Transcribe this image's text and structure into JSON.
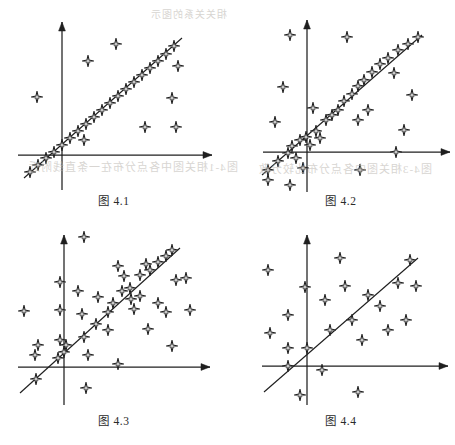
{
  "page": {
    "width": 455,
    "height": 445,
    "background": "#ffffff",
    "ink_color": "#1f1f1f",
    "marker_fill": "#ffffff",
    "marker_stroke": "#1f1f1f",
    "bleed_color": "#b9b4ae"
  },
  "bleed_through": [
    {
      "text": "图4-1相关图中各点分布在一条直线附近",
      "x": 28,
      "y": 158,
      "size": 11
    },
    {
      "text": "图4-3相关图中各点分布比较分散",
      "x": 258,
      "y": 160,
      "size": 11
    },
    {
      "text": "相关关系的图示",
      "x": 150,
      "y": 6,
      "size": 10
    }
  ],
  "chart_data": [
    {
      "id": "figure-4-1",
      "type": "scatter",
      "title": "图 4.1",
      "caption": "图 4.1",
      "correlation_label": "very strong positive linear correlation",
      "xlabel": "",
      "ylabel": "",
      "grid": false,
      "legend": false,
      "axes": {
        "origin": [
          62,
          155
        ],
        "x_axis": {
          "from": [
            18,
            155
          ],
          "to": [
            212,
            155
          ],
          "arrow": "right"
        },
        "y_axis": {
          "from": [
            62,
            190
          ],
          "to": [
            62,
            22
          ],
          "arrow": "up"
        }
      },
      "regression_line": {
        "from": [
          24,
          178
        ],
        "to": [
          182,
          38
        ]
      },
      "on_line_points": [
        [
          30,
          172
        ],
        [
          38,
          165
        ],
        [
          46,
          158
        ],
        [
          54,
          152
        ],
        [
          62,
          145
        ],
        [
          70,
          138
        ],
        [
          78,
          131
        ],
        [
          86,
          124
        ],
        [
          94,
          117
        ],
        [
          102,
          110
        ],
        [
          110,
          103
        ],
        [
          118,
          96
        ],
        [
          126,
          89
        ],
        [
          134,
          82
        ],
        [
          142,
          75
        ],
        [
          150,
          68
        ],
        [
          158,
          61
        ],
        [
          166,
          54
        ],
        [
          174,
          46
        ]
      ],
      "outlier_points": [
        [
          37,
          97
        ],
        [
          88,
          61
        ],
        [
          84,
          140
        ],
        [
          145,
          127
        ],
        [
          172,
          98
        ],
        [
          178,
          66
        ],
        [
          176,
          127
        ],
        [
          116,
          44
        ]
      ],
      "point_count": 27
    },
    {
      "id": "figure-4-2",
      "type": "scatter",
      "title": "图 4.2",
      "caption": "图 4.2",
      "correlation_label": "strong positive linear correlation with moderate scatter",
      "xlabel": "",
      "ylabel": "",
      "grid": false,
      "legend": false,
      "axes": {
        "origin": [
          307,
          152
        ],
        "x_axis": {
          "from": [
            263,
            152
          ],
          "to": [
            450,
            152
          ],
          "arrow": "right"
        },
        "y_axis": {
          "from": [
            307,
            192
          ],
          "to": [
            307,
            20
          ],
          "arrow": "up"
        }
      },
      "regression_line": {
        "from": [
          262,
          175
        ],
        "to": [
          422,
          35
        ]
      },
      "on_line_points": [
        [
          268,
          170
        ],
        [
          278,
          161
        ],
        [
          288,
          153
        ],
        [
          292,
          146
        ],
        [
          296,
          158
        ],
        [
          300,
          140
        ],
        [
          306,
          137
        ],
        [
          310,
          145
        ],
        [
          316,
          131
        ],
        [
          320,
          138
        ],
        [
          326,
          120
        ],
        [
          332,
          115
        ],
        [
          338,
          110
        ],
        [
          344,
          101
        ],
        [
          352,
          94
        ],
        [
          358,
          86
        ],
        [
          364,
          80
        ],
        [
          372,
          72
        ],
        [
          380,
          64
        ],
        [
          388,
          58
        ],
        [
          398,
          50
        ],
        [
          408,
          44
        ],
        [
          418,
          37
        ]
      ],
      "outlier_points": [
        [
          290,
          35
        ],
        [
          283,
          87
        ],
        [
          347,
          37
        ],
        [
          358,
          120
        ],
        [
          368,
          110
        ],
        [
          394,
          73
        ],
        [
          404,
          130
        ],
        [
          412,
          95
        ],
        [
          396,
          152
        ],
        [
          360,
          170
        ],
        [
          290,
          185
        ],
        [
          268,
          180
        ],
        [
          275,
          122
        ],
        [
          303,
          168
        ],
        [
          313,
          108
        ]
      ],
      "point_count": 38
    },
    {
      "id": "figure-4-3",
      "type": "scatter",
      "title": "图 4.3",
      "caption": "图 4.3",
      "correlation_label": "moderate positive correlation with wide scatter",
      "xlabel": "",
      "ylabel": "",
      "grid": false,
      "legend": false,
      "axes": {
        "origin": [
          64,
          367
        ],
        "x_axis": {
          "from": [
            18,
            367
          ],
          "to": [
            210,
            367
          ],
          "arrow": "right"
        },
        "y_axis": {
          "from": [
            64,
            405
          ],
          "to": [
            64,
            235
          ],
          "arrow": "up"
        }
      },
      "regression_line": {
        "from": [
          20,
          393
        ],
        "to": [
          180,
          248
        ]
      },
      "on_line_points": [
        [
          36,
          379
        ],
        [
          58,
          358
        ],
        [
          64,
          352
        ],
        [
          66,
          345
        ],
        [
          84,
          337
        ],
        [
          96,
          324
        ],
        [
          108,
          312
        ],
        [
          122,
          291
        ],
        [
          130,
          288
        ],
        [
          140,
          275
        ],
        [
          150,
          270
        ],
        [
          158,
          262
        ],
        [
          166,
          256
        ],
        [
          172,
          250
        ]
      ],
      "outlier_points": [
        [
          84,
          237
        ],
        [
          60,
          282
        ],
        [
          60,
          310
        ],
        [
          60,
          340
        ],
        [
          38,
          345
        ],
        [
          24,
          311
        ],
        [
          35,
          355
        ],
        [
          78,
          291
        ],
        [
          82,
          314
        ],
        [
          88,
          355
        ],
        [
          98,
          297
        ],
        [
          108,
          330
        ],
        [
          113,
          303
        ],
        [
          118,
          266
        ],
        [
          124,
          276
        ],
        [
          131,
          299
        ],
        [
          134,
          309
        ],
        [
          140,
          296
        ],
        [
          146,
          264
        ],
        [
          158,
          303
        ],
        [
          166,
          312
        ],
        [
          176,
          280
        ],
        [
          172,
          346
        ],
        [
          186,
          278
        ],
        [
          190,
          310
        ],
        [
          148,
          329
        ],
        [
          86,
          388
        ],
        [
          118,
          364
        ]
      ],
      "point_count": 42
    },
    {
      "id": "figure-4-4",
      "type": "scatter",
      "title": "图 4.4",
      "caption": "图 4.4",
      "correlation_label": "weak positive correlation, points widely dispersed",
      "xlabel": "",
      "ylabel": "",
      "grid": false,
      "legend": false,
      "axes": {
        "origin": [
          307,
          366
        ],
        "x_axis": {
          "from": [
            262,
            366
          ],
          "to": [
            448,
            366
          ],
          "arrow": "right"
        },
        "y_axis": {
          "from": [
            307,
            405
          ],
          "to": [
            307,
            235
          ],
          "arrow": "up"
        }
      },
      "regression_line": {
        "from": [
          264,
          392
        ],
        "to": [
          418,
          258
        ]
      },
      "on_line_points": [
        [
          288,
          366
        ],
        [
          307,
          348
        ],
        [
          330,
          330
        ],
        [
          368,
          295
        ],
        [
          410,
          260
        ]
      ],
      "outlier_points": [
        [
          268,
          270
        ],
        [
          288,
          315
        ],
        [
          270,
          333
        ],
        [
          288,
          348
        ],
        [
          305,
          287
        ],
        [
          322,
          370
        ],
        [
          325,
          300
        ],
        [
          340,
          258
        ],
        [
          345,
          286
        ],
        [
          352,
          320
        ],
        [
          362,
          340
        ],
        [
          358,
          392
        ],
        [
          380,
          306
        ],
        [
          388,
          330
        ],
        [
          398,
          283
        ],
        [
          406,
          320
        ],
        [
          300,
          395
        ],
        [
          416,
          286
        ]
      ],
      "point_count": 23
    }
  ],
  "panels": [
    {
      "id": "figure-4-1",
      "left": 0,
      "top": 0,
      "caption_top": 192
    },
    {
      "id": "figure-4-2",
      "left": 227,
      "top": 0,
      "caption_top": 192
    },
    {
      "id": "figure-4-3",
      "left": 0,
      "top": 222,
      "caption_top": 190
    },
    {
      "id": "figure-4-4",
      "left": 227,
      "top": 222,
      "caption_top": 190
    }
  ]
}
